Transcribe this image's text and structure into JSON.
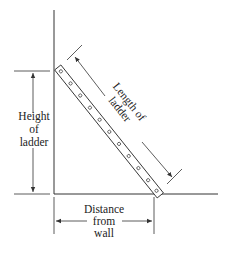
{
  "diagram": {
    "labels": {
      "height": [
        "Height",
        "of",
        "ladder"
      ],
      "length": [
        "Length of",
        "ladder"
      ],
      "distance": [
        "Distance",
        "from",
        "wall"
      ]
    },
    "elements": {
      "wall": "vertical wall line",
      "ground": "horizontal ground line",
      "ladder": "rectangular ladder with rungs",
      "rung_count": 11
    },
    "colors": {
      "line": "#333333",
      "background": "#ffffff"
    }
  }
}
